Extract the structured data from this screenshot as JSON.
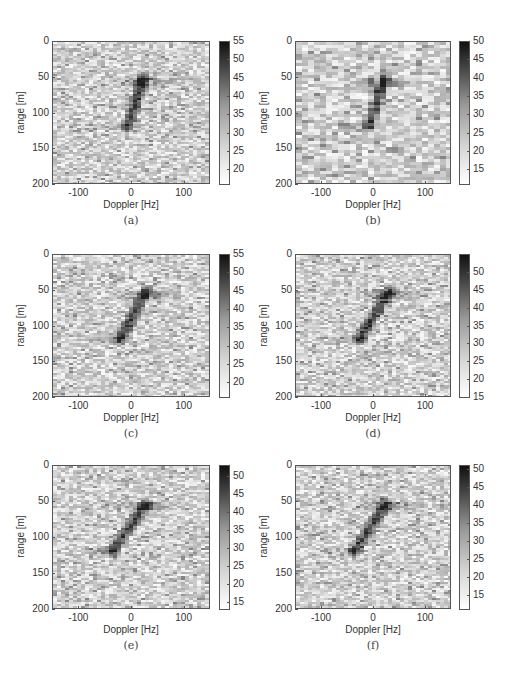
{
  "figure": {
    "panels": [
      {
        "caption": "(a)",
        "xlabel": "Doppler [Hz]",
        "ylabel": "range [m]",
        "xticks": [
          "-100",
          "0",
          "100"
        ],
        "yticks": [
          "0",
          "50",
          "100",
          "150",
          "200"
        ],
        "cbar_ticks": [
          "55",
          "50",
          "45",
          "40",
          "35",
          "30",
          "25",
          "20"
        ],
        "cbar_range": [
          16,
          55
        ]
      },
      {
        "caption": "(b)",
        "xlabel": "Doppler [Hz]",
        "ylabel": "range [m]",
        "xticks": [
          "-100",
          "0",
          "100"
        ],
        "yticks": [
          "0",
          "50",
          "100",
          "150",
          "200"
        ],
        "cbar_ticks": [
          "50",
          "45",
          "40",
          "35",
          "30",
          "25",
          "20",
          "15"
        ],
        "cbar_range": [
          11,
          50
        ]
      },
      {
        "caption": "(c)",
        "xlabel": "Doppler [Hz]",
        "ylabel": "range [m]",
        "xticks": [
          "-100",
          "0",
          "100"
        ],
        "yticks": [
          "0",
          "50",
          "100",
          "150",
          "200"
        ],
        "cbar_ticks": [
          "55",
          "50",
          "45",
          "40",
          "35",
          "30",
          "25",
          "20"
        ],
        "cbar_range": [
          16,
          55
        ]
      },
      {
        "caption": "(d)",
        "xlabel": "Doppler [Hz]",
        "ylabel": "range [m]",
        "xticks": [
          "-100",
          "0",
          "100"
        ],
        "yticks": [
          "0",
          "50",
          "100",
          "150",
          "200"
        ],
        "cbar_ticks": [
          "50",
          "45",
          "40",
          "35",
          "30",
          "25",
          "20",
          "15"
        ],
        "cbar_range": [
          15,
          55
        ]
      },
      {
        "caption": "(e)",
        "xlabel": "Doppler [Hz]",
        "ylabel": "range [m]",
        "xticks": [
          "-100",
          "0",
          "100"
        ],
        "yticks": [
          "0",
          "50",
          "100",
          "150",
          "200"
        ],
        "cbar_ticks": [
          "50",
          "45",
          "40",
          "35",
          "30",
          "25",
          "20",
          "15"
        ],
        "cbar_range": [
          13,
          53
        ]
      },
      {
        "caption": "(f)",
        "xlabel": "Doppler [Hz]",
        "ylabel": "range [m]",
        "xticks": [
          "-100",
          "0",
          "100"
        ],
        "yticks": [
          "0",
          "50",
          "100",
          "150",
          "200"
        ],
        "cbar_ticks": [
          "50",
          "45",
          "40",
          "35",
          "30",
          "25",
          "20",
          "15"
        ],
        "cbar_range": [
          11,
          51
        ]
      }
    ]
  },
  "chart_data": [
    {
      "type": "heatmap",
      "title": "(a)",
      "xlabel": "Doppler [Hz]",
      "ylabel": "range [m]",
      "xlim": [
        -150,
        150
      ],
      "ylim": [
        200,
        0
      ],
      "xticks": [
        -100,
        0,
        100
      ],
      "yticks": [
        0,
        50,
        100,
        150,
        200
      ],
      "colorbar": {
        "min": 16,
        "max": 55,
        "ticks": [
          20,
          25,
          30,
          35,
          40,
          45,
          50,
          55
        ]
      },
      "colormap": "gray_r",
      "features": {
        "target_streak": {
          "start": {
            "doppler": 20,
            "range": 50
          },
          "end": {
            "doppler": -10,
            "range": 118
          }
        },
        "horizontal_sidelobe_range": 55,
        "peak_value": 55
      }
    },
    {
      "type": "heatmap",
      "title": "(b)",
      "xlabel": "Doppler [Hz]",
      "ylabel": "range [m]",
      "xlim": [
        -150,
        150
      ],
      "ylim": [
        200,
        0
      ],
      "xticks": [
        -100,
        0,
        100
      ],
      "yticks": [
        0,
        50,
        100,
        150,
        200
      ],
      "colorbar": {
        "min": 11,
        "max": 50,
        "ticks": [
          15,
          20,
          25,
          30,
          35,
          40,
          45,
          50
        ]
      },
      "colormap": "gray_r",
      "features": {
        "target_streak": {
          "start": {
            "doppler": 18,
            "range": 50
          },
          "end": {
            "doppler": -15,
            "range": 118
          }
        },
        "horizontal_sidelobe_range": 55,
        "peak_value": 50,
        "coarse_cells": true
      }
    },
    {
      "type": "heatmap",
      "title": "(c)",
      "xlabel": "Doppler [Hz]",
      "ylabel": "range [m]",
      "xlim": [
        -150,
        150
      ],
      "ylim": [
        200,
        0
      ],
      "xticks": [
        -100,
        0,
        100
      ],
      "yticks": [
        0,
        50,
        100,
        150,
        200
      ],
      "colorbar": {
        "min": 16,
        "max": 55,
        "ticks": [
          20,
          25,
          30,
          35,
          40,
          45,
          50,
          55
        ]
      },
      "colormap": "gray_r",
      "features": {
        "target_streak": {
          "start": {
            "doppler": 25,
            "range": 50
          },
          "end": {
            "doppler": -25,
            "range": 118
          }
        },
        "horizontal_sidelobe_range": 55,
        "peak_value": 55
      }
    },
    {
      "type": "heatmap",
      "title": "(d)",
      "xlabel": "Doppler [Hz]",
      "ylabel": "range [m]",
      "xlim": [
        -150,
        150
      ],
      "ylim": [
        200,
        0
      ],
      "xticks": [
        -100,
        0,
        100
      ],
      "yticks": [
        0,
        50,
        100,
        150,
        200
      ],
      "colorbar": {
        "min": 15,
        "max": 55,
        "ticks": [
          15,
          20,
          25,
          30,
          35,
          40,
          45,
          50
        ]
      },
      "colormap": "gray_r",
      "features": {
        "target_streak": {
          "start": {
            "doppler": 28,
            "range": 50
          },
          "end": {
            "doppler": -32,
            "range": 118
          }
        },
        "horizontal_sidelobe_range": 55,
        "peak_value": 55
      }
    },
    {
      "type": "heatmap",
      "title": "(e)",
      "xlabel": "Doppler [Hz]",
      "ylabel": "range [m]",
      "xlim": [
        -150,
        150
      ],
      "ylim": [
        200,
        0
      ],
      "xticks": [
        -100,
        0,
        100
      ],
      "yticks": [
        0,
        50,
        100,
        150,
        200
      ],
      "colorbar": {
        "min": 13,
        "max": 53,
        "ticks": [
          15,
          20,
          25,
          30,
          35,
          40,
          45,
          50
        ]
      },
      "colormap": "gray_r",
      "features": {
        "target_streak": {
          "start": {
            "doppler": 25,
            "range": 52
          },
          "end": {
            "doppler": -40,
            "range": 118
          }
        },
        "horizontal_sidelobe_range": 55,
        "peak_value": 53
      }
    },
    {
      "type": "heatmap",
      "title": "(f)",
      "xlabel": "Doppler [Hz]",
      "ylabel": "range [m]",
      "xlim": [
        -150,
        150
      ],
      "ylim": [
        200,
        0
      ],
      "xticks": [
        -100,
        0,
        100
      ],
      "yticks": [
        0,
        50,
        100,
        150,
        200
      ],
      "colorbar": {
        "min": 11,
        "max": 51,
        "ticks": [
          15,
          20,
          25,
          30,
          35,
          40,
          45,
          50
        ]
      },
      "colormap": "gray_r",
      "features": {
        "target_streak": {
          "start": {
            "doppler": 22,
            "range": 52
          },
          "end": {
            "doppler": -40,
            "range": 118
          }
        },
        "horizontal_sidelobe_range": 55,
        "peak_value": 51
      }
    }
  ]
}
